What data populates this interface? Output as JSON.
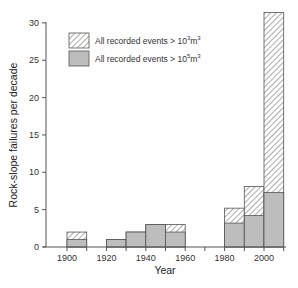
{
  "chart_data": {
    "type": "bar",
    "subtype": "stacked-overlay histogram",
    "title": "",
    "xlabel": "Year",
    "ylabel": "Rock-slope failures per decade",
    "xlim": [
      1890,
      2010
    ],
    "ylim": [
      0,
      30
    ],
    "xticks": [
      1900,
      1920,
      1940,
      1960,
      1980,
      2000
    ],
    "xticks_minor": [
      1910,
      1930,
      1950,
      1970,
      1990,
      2010
    ],
    "yticks": [
      0,
      5,
      10,
      15,
      20,
      25,
      30
    ],
    "grid": false,
    "legend_position": "upper-left",
    "categories": [
      "1900",
      "1920",
      "1930",
      "1940",
      "1950",
      "1980",
      "1990",
      "2000"
    ],
    "bin_start": [
      1900,
      1920,
      1930,
      1940,
      1950,
      1980,
      1990,
      2000
    ],
    "bin_width": 10,
    "series": [
      {
        "name": "All recorded events > 10^3 m^3",
        "label_main": "All recorded events > 10",
        "label_sup": "3",
        "label_unit": "m",
        "label_unit_sup": "3",
        "fill": "hatched",
        "values": [
          2,
          1,
          2,
          3,
          3,
          5.2,
          8.1,
          31.4
        ]
      },
      {
        "name": "All recorded events > 10^5 m^3",
        "label_main": "All recorded events > 10",
        "label_sup": "5",
        "label_unit": "m",
        "label_unit_sup": "3",
        "fill": "#bdbdbd",
        "values": [
          1,
          1,
          2,
          3,
          2,
          3.2,
          4.2,
          7.3
        ]
      }
    ]
  },
  "colors": {
    "axis": "#555555",
    "bar_grey": "#bdbdbd",
    "bar_stroke": "#555555",
    "hatch": "#666666",
    "text": "#333333"
  }
}
